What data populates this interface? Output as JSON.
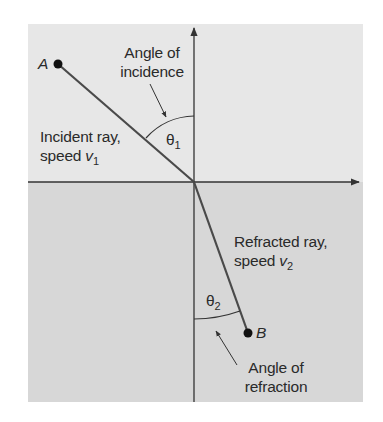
{
  "diagram": {
    "colors": {
      "upper_medium": "#e6e6e6",
      "lower_medium": "#d6d6d6",
      "line": "#333333",
      "ray": "#4a4a4a",
      "background": "#ffffff"
    },
    "points": [
      {
        "id": "A",
        "label": "A"
      },
      {
        "id": "B",
        "label": "B"
      }
    ],
    "labels": {
      "incidence_angle_line1": "Angle of",
      "incidence_angle_line2": "incidence",
      "incident_ray_line1": "Incident ray,",
      "incident_ray_speed": "speed",
      "incident_ray_var": "v",
      "incident_ray_sub": "1",
      "theta1_symbol": "θ",
      "theta1_sub": "1",
      "refracted_ray_line1": "Refracted ray,",
      "refracted_ray_speed": "speed",
      "refracted_ray_var": "v",
      "refracted_ray_sub": "2",
      "theta2_symbol": "θ",
      "theta2_sub": "2",
      "refraction_angle_line1": "Angle of",
      "refraction_angle_line2": "refraction"
    }
  }
}
